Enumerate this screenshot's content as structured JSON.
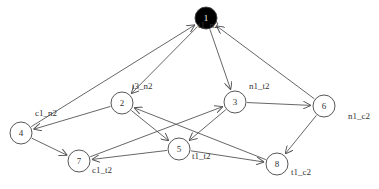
{
  "diagram": {
    "type": "directed-graph",
    "nodes": [
      {
        "id": "1",
        "label": "t1_n2",
        "x": 206,
        "y": 18,
        "filled": true
      },
      {
        "id": "2",
        "label": "t3_n2",
        "x": 122,
        "y": 103,
        "filled": false
      },
      {
        "id": "3",
        "label": "n1_t2",
        "x": 235,
        "y": 102,
        "filled": false
      },
      {
        "id": "4",
        "label": "c1_n2",
        "x": 21,
        "y": 133,
        "filled": false
      },
      {
        "id": "5",
        "label": "t1_t2",
        "x": 179,
        "y": 149,
        "filled": false
      },
      {
        "id": "6",
        "label": "n1_c2",
        "x": 324,
        "y": 106,
        "filled": false
      },
      {
        "id": "7",
        "label": "c1_t2",
        "x": 79,
        "y": 161,
        "filled": false
      },
      {
        "id": "8",
        "label": "t1_c2",
        "x": 277,
        "y": 164,
        "filled": false
      }
    ],
    "edges": [
      {
        "from": "1",
        "to": "2"
      },
      {
        "from": "1",
        "to": "3"
      },
      {
        "from": "4",
        "to": "1"
      },
      {
        "from": "6",
        "to": "1"
      },
      {
        "from": "2",
        "to": "4"
      },
      {
        "from": "2",
        "to": "5"
      },
      {
        "from": "3",
        "to": "5"
      },
      {
        "from": "3",
        "to": "6"
      },
      {
        "from": "4",
        "to": "7"
      },
      {
        "from": "5",
        "to": "7"
      },
      {
        "from": "7",
        "to": "3"
      },
      {
        "from": "5",
        "to": "8"
      },
      {
        "from": "6",
        "to": "8"
      },
      {
        "from": "8",
        "to": "2"
      }
    ],
    "node_radius": 11,
    "colors": {
      "edge": "#555555",
      "node_stroke": "#444444",
      "filled_node": "#000000",
      "text": "#333333",
      "filled_text": "#ffffff"
    }
  },
  "labels": {
    "n1": "1",
    "n2": "2",
    "n3": "3",
    "n4": "4",
    "n5": "5",
    "n6": "6",
    "n7": "7",
    "n8": "8",
    "l1": "t1_n2",
    "l2": "t3_n2",
    "l3": "n1_t2",
    "l4": "c1_n2",
    "l5": "t1_t2",
    "l6": "n1_c2",
    "l7": "c1_t2",
    "l8": "t1_c2"
  }
}
